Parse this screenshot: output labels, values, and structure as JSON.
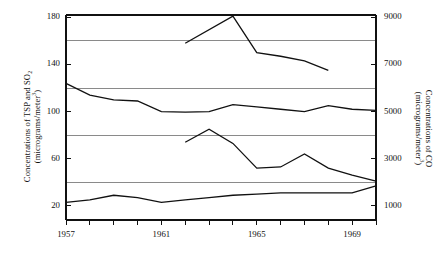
{
  "chart_data": {
    "type": "line",
    "title": "",
    "xlabel": "",
    "ylabel": "Concentrations of TSP and SO2 (micrograms/meter3)",
    "y2label": "Concentrations of CO (micrograms/meter3)",
    "xlim": [
      1957,
      1970
    ],
    "ylim": [
      8,
      182
    ],
    "y2lim": [
      400,
      9100
    ],
    "grid": true,
    "gridlines_y": [
      40,
      80,
      120,
      160
    ],
    "legend": "none",
    "x_ticks": [
      1957,
      1958,
      1959,
      1960,
      1961,
      1962,
      1963,
      1964,
      1965,
      1966,
      1967,
      1968,
      1969,
      1970
    ],
    "x_tick_labels": [
      "1957",
      "",
      "",
      "",
      "1961",
      "",
      "",
      "",
      "1965",
      "",
      "",
      "",
      "1969",
      ""
    ],
    "y_ticks": [
      20,
      60,
      100,
      140,
      180
    ],
    "y_tick_labels": [
      "20",
      "60",
      "100",
      "140",
      "180"
    ],
    "y2_ticks": [
      1000,
      3000,
      5000,
      7000,
      9000
    ],
    "y2_tick_labels": [
      "1000",
      "3000",
      "5000",
      "7000",
      "9000"
    ],
    "series": [
      {
        "name": "CO",
        "axis": "right",
        "x": [
          1962,
          1964,
          1965,
          1966,
          1967,
          1968
        ],
        "values": [
          7900,
          9050,
          7500,
          7350,
          7150,
          6750
        ],
        "values_left_scale": [
          164,
          181,
          151,
          148,
          144,
          135
        ]
      },
      {
        "name": "TSP",
        "axis": "left",
        "x": [
          1957,
          1958,
          1959,
          1960,
          1961,
          1962,
          1963,
          1964,
          1965,
          1966,
          1967,
          1968,
          1969,
          1970
        ],
        "values": [
          124,
          114,
          110,
          109,
          100,
          99.5,
          100,
          106,
          104,
          102,
          100,
          105,
          102,
          101
        ]
      },
      {
        "name": "SO2",
        "axis": "left",
        "x": [
          1962,
          1963,
          1964,
          1965,
          1966,
          1967,
          1968,
          1969,
          1970
        ],
        "values": [
          74,
          85,
          73,
          52,
          53,
          64,
          52,
          46,
          41
        ]
      },
      {
        "name": "lower-series",
        "axis": "left",
        "x": [
          1957,
          1958,
          1959,
          1960,
          1961,
          1962,
          1963,
          1964,
          1965,
          1966,
          1967,
          1968,
          1969,
          1970
        ],
        "values": [
          23,
          25,
          29,
          27,
          23,
          25,
          27,
          29,
          30,
          31,
          31,
          31,
          31,
          37
        ]
      }
    ]
  },
  "axes": {
    "left_title_line1": "Concentrations of TSP and SO",
    "left_title_sub": "2",
    "left_title_line2_a": "(micrograms/meter",
    "left_title_line2_sup": "3",
    "left_title_line2_b": ")",
    "right_title_line1": "Concentrations of CO",
    "right_title_line2_a": "(micrograms/meter",
    "right_title_line2_sup": "3",
    "right_title_line2_b": ")"
  }
}
